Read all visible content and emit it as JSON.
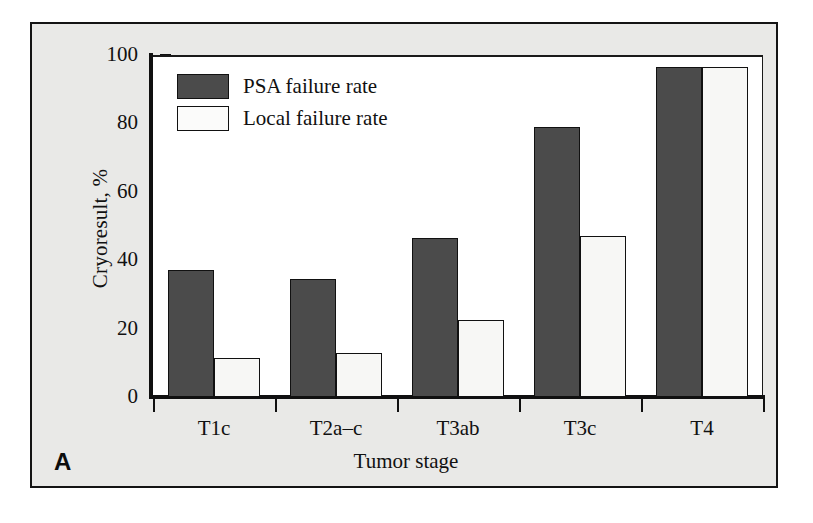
{
  "figure": {
    "panel_letter": "A",
    "background_color": "#e9e9e7",
    "plot_background_color": "#ffffff",
    "frame_color": "#141414"
  },
  "legend": {
    "position": "top-left-inside",
    "items": [
      {
        "label": "PSA failure rate",
        "color": "#4b4b4b",
        "key": "psa"
      },
      {
        "label": "Local failure rate",
        "color": "#f7f7f5",
        "key": "local"
      }
    ]
  },
  "chart_data": {
    "type": "bar",
    "title": "",
    "xlabel": "Tumor stage",
    "ylabel": "Cryoresult, %",
    "ylim": [
      0,
      100
    ],
    "yticks": [
      0,
      20,
      40,
      60,
      80,
      100
    ],
    "ytick_labels": [
      "0",
      "20",
      "40",
      "60",
      "80",
      "100"
    ],
    "grid": false,
    "legend_position": "upper left",
    "categories": [
      "T1c",
      "T2a–c",
      "T3ab",
      "T3c",
      "T4"
    ],
    "series": [
      {
        "name": "PSA failure rate",
        "color": "#4b4b4b",
        "values": [
          37,
          34.5,
          46.5,
          79,
          96.5
        ]
      },
      {
        "name": "Local failure rate",
        "color": "#f7f7f5",
        "values": [
          11.5,
          13,
          22.5,
          47,
          96.5
        ]
      }
    ]
  }
}
